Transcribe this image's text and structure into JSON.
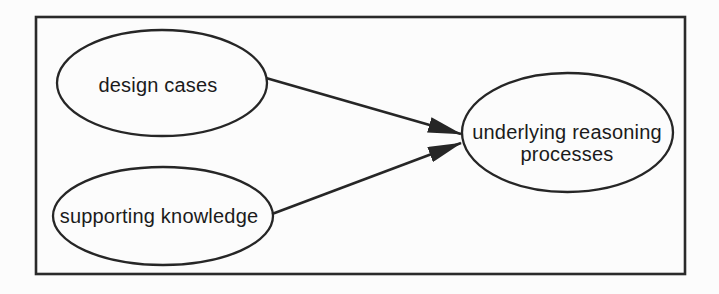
{
  "figure": {
    "type": "concept-diagram",
    "background": "#fcfcfc",
    "line_color": "#262626",
    "text_color": "#1b1b1b",
    "nodes": [
      {
        "id": "design-cases",
        "shape": "ellipse",
        "label": "design cases"
      },
      {
        "id": "supporting-knowledge",
        "shape": "ellipse",
        "label": "supporting knowledge"
      },
      {
        "id": "underlying-reasoning-processes",
        "shape": "ellipse",
        "label": "underlying reasoning processes",
        "label_line1": "underlying reasoning",
        "label_line2": "processes"
      }
    ],
    "edges": [
      {
        "from": "design-cases",
        "to": "underlying-reasoning-processes",
        "style": "solid-line-filled-arrowhead"
      },
      {
        "from": "supporting-knowledge",
        "to": "underlying-reasoning-processes",
        "style": "solid-line-filled-arrowhead"
      }
    ]
  }
}
